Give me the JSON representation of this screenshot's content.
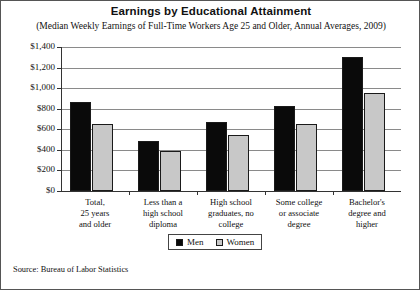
{
  "chart_data": {
    "type": "bar",
    "title": "Earnings by Educational Attainment",
    "subtitle": "(Median Weekly Earnings of Full-Time Workers Age 25 and Older, Annual Averages, 2009)",
    "categories": [
      "Total,\n25 years\nand older",
      "Less than a\nhigh school\ndiploma",
      "High school\ngraduates, no\ncollege",
      "Some college\nor associate\ndegree",
      "Bachelor's\ndegree and\nhigher"
    ],
    "series": [
      {
        "name": "Men",
        "values": [
          865,
          490,
          675,
          825,
          1300
        ],
        "color": "#0a0a0a"
      },
      {
        "name": "Women",
        "values": [
          655,
          390,
          540,
          650,
          955
        ],
        "color": "#c8c8c8"
      }
    ],
    "xlabel": "",
    "ylabel": "",
    "ylim": [
      0,
      1400
    ],
    "ytick_values": [
      0,
      200,
      400,
      600,
      800,
      1000,
      1200,
      1400
    ],
    "ytick_labels": [
      "$0",
      "$200",
      "$400",
      "$600",
      "$800",
      "$1,000",
      "$1,200",
      "$1,400"
    ],
    "grid": true,
    "legend_position": "bottom-center",
    "source": "Source: Bureau of Labor Statistics"
  }
}
